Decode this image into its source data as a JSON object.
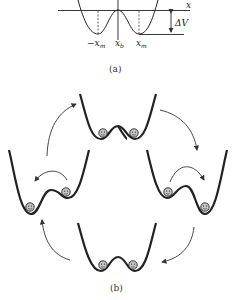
{
  "figure_a": {
    "caption": "(a)",
    "axis_label": "x",
    "tick_labels": {
      "neg_xm": "−x",
      "neg_xm_sub": "m",
      "xb": "x",
      "xb_sub": "b",
      "xm": "x",
      "xm_sub": "m"
    },
    "barrier_label": "ΔV"
  },
  "figure_b": {
    "caption": "(b)",
    "panels": [
      {
        "position": "top",
        "state": "both balls in separate wells"
      },
      {
        "position": "right",
        "state": "one ball hopped to right well"
      },
      {
        "position": "bottom",
        "state": "both balls in separate wells"
      },
      {
        "position": "left",
        "state": "one ball hopped to left well"
      }
    ],
    "cycle_direction": "clockwise"
  },
  "colors": {
    "line": "#222222",
    "ball_fill": "#bbbbbb"
  }
}
